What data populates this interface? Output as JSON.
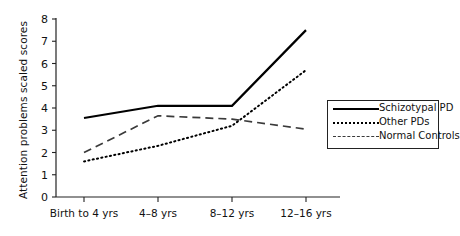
{
  "chart_data": {
    "type": "line",
    "title": "",
    "xlabel": "",
    "ylabel": "Attention problems scaled scores",
    "categories": [
      "Birth to 4 yrs",
      "4–8 yrs",
      "8–12 yrs",
      "12–16 yrs"
    ],
    "ylim": [
      0,
      8
    ],
    "yticks": [
      "0",
      "1",
      "2",
      "3",
      "4",
      "5",
      "6",
      "7",
      "8"
    ],
    "grid": false,
    "legend_position": "right-middle",
    "series": [
      {
        "name": "Schizotypal PD",
        "style": "solid",
        "color": "#000000",
        "values": [
          3.55,
          4.1,
          4.1,
          7.5
        ]
      },
      {
        "name": "Other PDs",
        "style": "dotted",
        "color": "#000000",
        "values": [
          1.6,
          2.3,
          3.2,
          5.7
        ]
      },
      {
        "name": "Normal Controls",
        "style": "dashed",
        "color": "#3a3a3a",
        "values": [
          2.0,
          3.65,
          3.5,
          3.05
        ]
      }
    ]
  }
}
